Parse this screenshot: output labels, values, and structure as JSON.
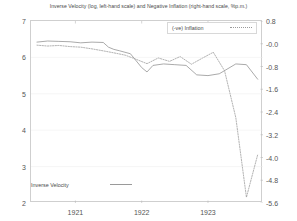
{
  "chart_data": {
    "type": "line",
    "title": "Inverse Velocity (log, left-hand scale) and Negative Inflation (right-hand scale, %p.m.)",
    "xlabel": "",
    "ylabel_left": "Inverse Velocity (log)",
    "ylabel_right": "Negative Inflation (%p.m.)",
    "grid": true,
    "legend_position": "top-right",
    "x_tick_labels": [
      "1921",
      "1922",
      "1923"
    ],
    "x_tick_values": [
      1921,
      1922,
      1923
    ],
    "xlim": [
      1920.33,
      1923.83
    ],
    "y_left_ticks": [
      "7",
      "6",
      "5",
      "4",
      "3",
      "2"
    ],
    "y_left_values": [
      7,
      6,
      5,
      4,
      3,
      2
    ],
    "ylim_left": [
      2,
      7
    ],
    "y_right_ticks": [
      "0.8",
      "-0.0",
      "-0.8",
      "-1.6",
      "-2.4",
      "-3.2",
      "-4.0",
      "-4.8",
      "-5.6"
    ],
    "y_right_values": [
      0.8,
      0.0,
      -0.8,
      -1.6,
      -2.4,
      -3.2,
      -4.0,
      -4.8,
      -5.6
    ],
    "ylim_right": [
      -5.6,
      0.8
    ],
    "series": [
      {
        "name": "Inverse Velocity",
        "style": "solid",
        "axis": "left",
        "color": "#8d8d8d",
        "x": [
          1920.42,
          1920.58,
          1920.75,
          1920.92,
          1921.08,
          1921.25,
          1921.42,
          1921.5,
          1921.58,
          1921.67,
          1921.83,
          1922.0,
          1922.08,
          1922.17,
          1922.33,
          1922.5,
          1922.67,
          1922.83,
          1923.0,
          1923.17,
          1923.42,
          1923.58,
          1923.75
        ],
        "y": [
          6.42,
          6.45,
          6.44,
          6.43,
          6.4,
          6.42,
          6.41,
          6.28,
          6.22,
          6.18,
          6.1,
          5.72,
          5.6,
          5.78,
          5.82,
          5.8,
          5.78,
          5.52,
          5.5,
          5.55,
          5.82,
          5.8,
          5.4
        ]
      },
      {
        "name": "(-ve) Inflation",
        "style": "dotted",
        "axis": "right",
        "color": "#a0a0a0",
        "x": [
          1920.42,
          1920.58,
          1920.75,
          1920.92,
          1921.08,
          1921.25,
          1921.42,
          1921.58,
          1921.75,
          1921.92,
          1922.08,
          1922.25,
          1922.42,
          1922.58,
          1922.75,
          1922.92,
          1923.08,
          1923.25,
          1923.42,
          1923.58,
          1923.75
        ],
        "y": [
          -0.05,
          -0.08,
          -0.06,
          -0.1,
          -0.12,
          -0.18,
          -0.25,
          -0.32,
          -0.4,
          -0.55,
          -0.7,
          -0.5,
          -0.62,
          -0.45,
          -0.72,
          -0.5,
          -0.3,
          -0.95,
          -2.6,
          -5.4,
          -3.9
        ]
      }
    ],
    "annotations": [
      {
        "text": "(-ve) Inflation",
        "type": "legend-entry"
      },
      {
        "text": "Inverse Velocity",
        "type": "legend-entry"
      }
    ]
  }
}
